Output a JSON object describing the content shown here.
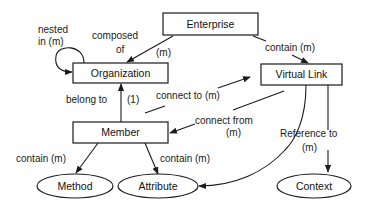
{
  "diagram": {
    "type": "entity-relationship",
    "colors": {
      "stroke": "#1a1a1a",
      "fill": "#ffffff",
      "text": "#111111"
    },
    "nodes": {
      "enterprise": {
        "label": "Enterprise",
        "shape": "rectangle"
      },
      "organization": {
        "label": "Organization",
        "shape": "rectangle"
      },
      "virtual_link": {
        "label": "Virtual Link",
        "shape": "rectangle"
      },
      "member": {
        "label": "Member",
        "shape": "rectangle"
      },
      "method": {
        "label": "Method",
        "shape": "ellipse"
      },
      "attribute": {
        "label": "Attribute",
        "shape": "ellipse"
      },
      "context": {
        "label": "Context",
        "shape": "ellipse"
      }
    },
    "edges": {
      "nested_in": {
        "from": "organization",
        "to": "organization",
        "label_line1": "nested",
        "label_line2": "in (m)"
      },
      "composed_of": {
        "from": "enterprise",
        "to": "organization",
        "label_line1": "composed",
        "label_line2": "of",
        "multiplicity": "(m)"
      },
      "contain_vlink": {
        "from": "enterprise",
        "to": "virtual_link",
        "label": "contain (m)"
      },
      "belong_to": {
        "from": "member",
        "to": "organization",
        "label": "belong to",
        "multiplicity": "(1)"
      },
      "connect_to": {
        "from": "member",
        "to": "virtual_link",
        "label": "connect to (m)"
      },
      "connect_from": {
        "from": "virtual_link",
        "to": "member",
        "label_line1": "connect from",
        "label_line2": "(m)"
      },
      "contain_method": {
        "from": "member",
        "to": "method",
        "label": "contain (m)"
      },
      "contain_attribute": {
        "from": "member",
        "to": "attribute",
        "label": "contain (m)"
      },
      "reference_to": {
        "from": "virtual_link",
        "to": "context",
        "label_line1": "Reference to",
        "label_line2": "(m)"
      },
      "vlink_attribute": {
        "from": "virtual_link",
        "to": "attribute"
      }
    }
  }
}
